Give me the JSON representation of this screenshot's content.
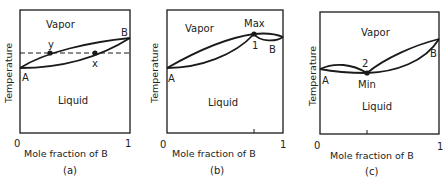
{
  "figure": {
    "panels": [
      {
        "id": "a",
        "caption": "(a)",
        "region_upper": "Vapor",
        "region_lower": "Liquid",
        "ylabel": "Temperature",
        "xlabel": "Mole fraction of B",
        "x_tick_0": "0",
        "x_tick_1": "1",
        "point_A": "A",
        "point_B": "B",
        "point_y": "y",
        "point_x": "x"
      },
      {
        "id": "b",
        "caption": "(b)",
        "region_upper": "Vapor",
        "region_lower": "Liquid",
        "ylabel": "Temperature",
        "xlabel": "Mole fraction of B",
        "x_tick_0": "0",
        "x_tick_1": "1",
        "point_A": "A",
        "point_B": "B",
        "extremum_label": "Max",
        "extremum_num": "1"
      },
      {
        "id": "c",
        "caption": "(c)",
        "region_upper": "Vapor",
        "region_lower": "Liquid",
        "ylabel": "Temperature",
        "xlabel": "Mole fraction of B",
        "x_tick_0": "0",
        "x_tick_1": "1",
        "point_A": "A",
        "point_B": "B",
        "extremum_label": "Min",
        "extremum_num": "2"
      }
    ],
    "colors": {
      "line": "#1a1a1a",
      "background": "#ffffff"
    }
  }
}
